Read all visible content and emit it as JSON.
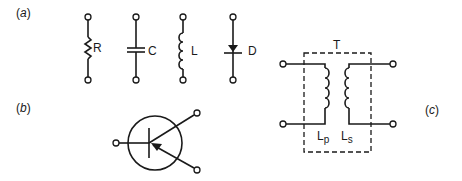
{
  "panels": {
    "a": {
      "label": "(a)",
      "components": [
        {
          "symbol": "resistor",
          "label": "R"
        },
        {
          "symbol": "capacitor",
          "label": "C"
        },
        {
          "symbol": "inductor",
          "label": "L"
        },
        {
          "symbol": "diode",
          "label": "D"
        }
      ]
    },
    "b": {
      "label": "(b)",
      "symbol": "bipolar-transistor"
    },
    "c": {
      "label": "(c)",
      "symbol": "transformer",
      "title": "T",
      "primary_label": "L",
      "primary_sub": "p",
      "secondary_label": "L",
      "secondary_sub": "s"
    }
  }
}
